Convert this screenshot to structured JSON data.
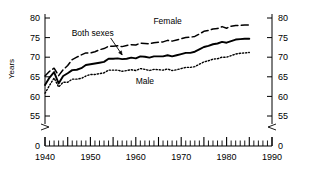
{
  "chart_data": {
    "type": "line",
    "title": "",
    "xlabel": "",
    "ylabel": "Years",
    "xlim": [
      1940,
      1990
    ],
    "ylim": [
      55,
      80
    ],
    "y_axis_break": true,
    "y_break_label": "0",
    "grid": false,
    "legend_position": "inline-annotations",
    "y_ticks": [
      "55",
      "60",
      "65",
      "70",
      "75",
      "80"
    ],
    "y_tick_values": [
      55,
      60,
      65,
      70,
      75,
      80
    ],
    "x_ticks": [
      "1940",
      "1950",
      "1960",
      "1970",
      "1980",
      "1990"
    ],
    "x_tick_values": [
      1940,
      1950,
      1960,
      1970,
      1980,
      1990
    ],
    "x_minor_tick_interval": 1,
    "x_major_tick_interval": 5,
    "annotations": [
      {
        "text": "Female",
        "x": 1967,
        "y": 79.2
      },
      {
        "text": "Both sexes",
        "x": 1950.5,
        "y": 76.3,
        "arrow_to_x": 1957,
        "arrow_to_y": 70.2
      },
      {
        "text": "Male",
        "x": 1962,
        "y": 64.0
      }
    ],
    "series": [
      {
        "name": "Female",
        "style": "dashed",
        "x": [
          1940,
          1941,
          1942,
          1943,
          1944,
          1945,
          1946,
          1947,
          1948,
          1949,
          1950,
          1951,
          1952,
          1953,
          1954,
          1955,
          1956,
          1957,
          1958,
          1959,
          1960,
          1961,
          1962,
          1963,
          1964,
          1965,
          1966,
          1967,
          1968,
          1969,
          1970,
          1971,
          1972,
          1973,
          1974,
          1975,
          1976,
          1977,
          1978,
          1979,
          1980,
          1981,
          1982,
          1983,
          1984,
          1985
        ],
        "values": [
          65.2,
          66.4,
          67.2,
          65.3,
          66.8,
          67.9,
          69.4,
          70.0,
          70.6,
          71.1,
          71.1,
          71.4,
          71.9,
          72.2,
          72.8,
          72.8,
          72.9,
          72.7,
          73.0,
          73.2,
          73.1,
          73.6,
          73.5,
          73.4,
          73.7,
          73.8,
          73.9,
          74.3,
          74.1,
          74.4,
          74.7,
          75.0,
          75.1,
          75.3,
          75.9,
          76.6,
          76.8,
          77.2,
          77.3,
          77.8,
          77.4,
          77.9,
          78.1,
          78.1,
          78.2,
          78.2
        ]
      },
      {
        "name": "Both sexes",
        "style": "solid",
        "x": [
          1940,
          1941,
          1942,
          1943,
          1944,
          1945,
          1946,
          1947,
          1948,
          1949,
          1950,
          1951,
          1952,
          1953,
          1954,
          1955,
          1956,
          1957,
          1958,
          1959,
          1960,
          1961,
          1962,
          1963,
          1964,
          1965,
          1966,
          1967,
          1968,
          1969,
          1970,
          1971,
          1972,
          1973,
          1974,
          1975,
          1976,
          1977,
          1978,
          1979,
          1980,
          1981,
          1982,
          1983,
          1984,
          1985
        ],
        "values": [
          62.9,
          64.8,
          66.2,
          63.3,
          65.2,
          65.9,
          66.7,
          66.8,
          67.2,
          68.0,
          68.2,
          68.4,
          68.6,
          68.8,
          69.6,
          69.6,
          69.7,
          69.5,
          69.6,
          69.9,
          69.7,
          70.2,
          70.1,
          69.9,
          70.2,
          70.2,
          70.2,
          70.5,
          70.2,
          70.5,
          70.8,
          71.1,
          71.1,
          71.4,
          72.0,
          72.6,
          72.9,
          73.3,
          73.5,
          73.9,
          73.7,
          74.1,
          74.5,
          74.6,
          74.7,
          74.7
        ]
      },
      {
        "name": "Male",
        "style": "dotted",
        "x": [
          1940,
          1941,
          1942,
          1943,
          1944,
          1945,
          1946,
          1947,
          1948,
          1949,
          1950,
          1951,
          1952,
          1953,
          1954,
          1955,
          1956,
          1957,
          1958,
          1959,
          1960,
          1961,
          1962,
          1963,
          1964,
          1965,
          1966,
          1967,
          1968,
          1969,
          1970,
          1971,
          1972,
          1973,
          1974,
          1975,
          1976,
          1977,
          1978,
          1979,
          1980,
          1981,
          1982,
          1983,
          1984,
          1985
        ],
        "values": [
          60.8,
          62.8,
          64.7,
          62.4,
          63.6,
          63.6,
          64.4,
          64.4,
          64.6,
          65.2,
          65.6,
          65.6,
          65.8,
          66.0,
          66.7,
          66.7,
          66.7,
          66.4,
          66.6,
          66.8,
          66.6,
          67.1,
          66.9,
          66.6,
          66.9,
          66.8,
          66.7,
          67.0,
          66.6,
          66.8,
          67.1,
          67.4,
          67.4,
          67.6,
          68.2,
          68.8,
          69.1,
          69.5,
          69.6,
          70.0,
          70.0,
          70.4,
          70.8,
          71.0,
          71.1,
          71.2
        ]
      }
    ]
  },
  "axes": {
    "left_title": "Years",
    "left_zero_label": "0",
    "right_zero_label": "0"
  }
}
